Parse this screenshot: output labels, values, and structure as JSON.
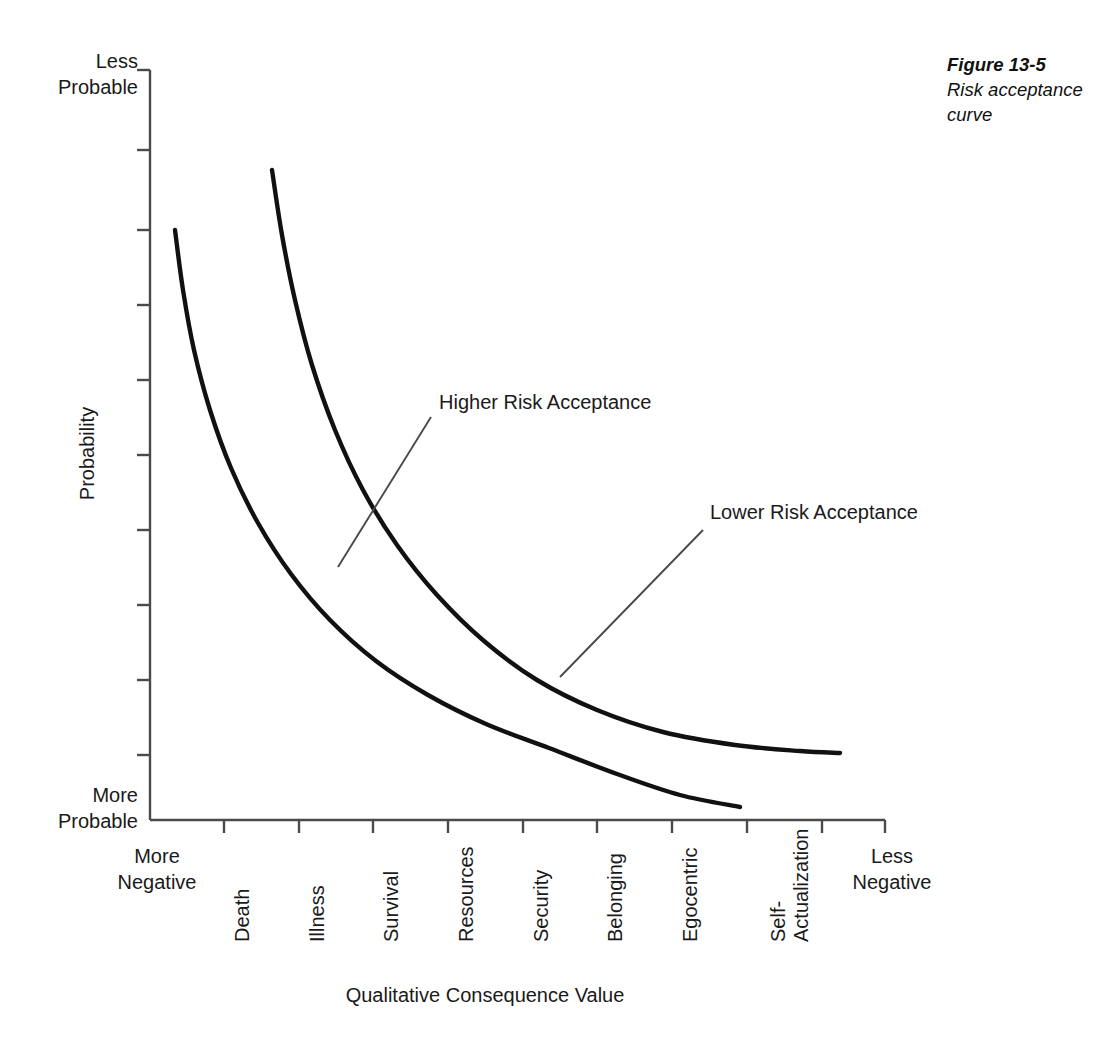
{
  "caption": {
    "number": "Figure 13-5",
    "text": "Risk acceptance curve"
  },
  "chart_data": {
    "type": "line",
    "title": "Risk acceptance curve",
    "xlabel": "Qualitative Consequence Value",
    "ylabel": "Probability",
    "grid": false,
    "legend_position": "inline-annotations",
    "axis_end_labels": {
      "y_top": "Less\nProbable",
      "y_bottom": "More\nProbable",
      "x_left": "More\nNegative",
      "x_right": "Less\nNegative"
    },
    "categories": [
      "Death",
      "Illness",
      "Survival",
      "Resources",
      "Security",
      "Belonging",
      "Egocentric",
      "Self-\nActualization"
    ],
    "category_tick_x": [
      224,
      299,
      373,
      448,
      523,
      597,
      672,
      747
    ],
    "x_axis_range_px": [
      150,
      885
    ],
    "y_axis_range_px": [
      70,
      820
    ],
    "y_tick_px": [
      70,
      150,
      230,
      305,
      380,
      455,
      530,
      605,
      680,
      755
    ],
    "series": [
      {
        "name": "Lower Risk Acceptance",
        "description": "Upper curve - decays from high probability, flattens higher above axis",
        "points": [
          [
            272,
            170
          ],
          [
            282,
            235
          ],
          [
            295,
            300
          ],
          [
            312,
            365
          ],
          [
            335,
            430
          ],
          [
            363,
            490
          ],
          [
            397,
            545
          ],
          [
            437,
            595
          ],
          [
            484,
            641
          ],
          [
            537,
            680
          ],
          [
            597,
            710
          ],
          [
            663,
            732
          ],
          [
            735,
            745
          ],
          [
            800,
            751
          ],
          [
            840,
            753
          ]
        ]
      },
      {
        "name": "Higher Risk Acceptance",
        "description": "Lower curve - decays from high probability, flattens nearer the axis",
        "points": [
          [
            175,
            230
          ],
          [
            183,
            290
          ],
          [
            194,
            350
          ],
          [
            210,
            410
          ],
          [
            231,
            468
          ],
          [
            258,
            523
          ],
          [
            291,
            574
          ],
          [
            330,
            620
          ],
          [
            376,
            661
          ],
          [
            428,
            695
          ],
          [
            486,
            724
          ],
          [
            549,
            748
          ],
          [
            617,
            774
          ],
          [
            680,
            795
          ],
          [
            740,
            807
          ]
        ]
      }
    ],
    "annotations": [
      {
        "label": "Higher Risk Acceptance",
        "label_x": 439,
        "label_y": 391,
        "leader_from": [
          431,
          417
        ],
        "leader_to": [
          338,
          567
        ]
      },
      {
        "label": "Lower Risk Acceptance",
        "label_x": 710,
        "label_y": 501,
        "leader_from": [
          703,
          530
        ],
        "leader_to": [
          560,
          677
        ]
      }
    ]
  },
  "styling": {
    "curve_color": "#111111",
    "axis_color": "#4a4a4a",
    "leader_color": "#4a4a4a",
    "background": "#ffffff"
  }
}
